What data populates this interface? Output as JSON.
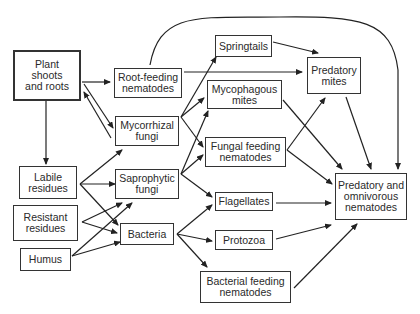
{
  "diagram": {
    "type": "soil food web",
    "nodes": [
      {
        "id": "plant",
        "label": "Plant\nshoots\nand roots"
      },
      {
        "id": "root_nem",
        "label": "Root-feeding\nnematodes"
      },
      {
        "id": "myco_fungi",
        "label": "Mycorrhizal\nfungi"
      },
      {
        "id": "labile",
        "label": "Labile\nresidues"
      },
      {
        "id": "resistant",
        "label": "Resistant\nresidues"
      },
      {
        "id": "humus",
        "label": "Humus"
      },
      {
        "id": "sapro",
        "label": "Saprophytic\nfungi"
      },
      {
        "id": "bacteria",
        "label": "Bacteria"
      },
      {
        "id": "springtails",
        "label": "Springtails"
      },
      {
        "id": "myco_mites",
        "label": "Mycophagous\nmites"
      },
      {
        "id": "fungal_nem",
        "label": "Fungal feeding\nnematodes"
      },
      {
        "id": "flagellates",
        "label": "Flagellates"
      },
      {
        "id": "protozoa",
        "label": "Protozoa"
      },
      {
        "id": "bact_nem",
        "label": "Bacterial feeding\nnematodes"
      },
      {
        "id": "pred_mites",
        "label": "Predatory\nmites"
      },
      {
        "id": "pred_nem",
        "label": "Predatory and\nomnivorous\nnematodes"
      }
    ],
    "edges": [
      [
        "plant",
        "root_nem"
      ],
      [
        "plant",
        "myco_fungi"
      ],
      [
        "myco_fungi",
        "plant"
      ],
      [
        "plant",
        "labile"
      ],
      [
        "labile",
        "sapro"
      ],
      [
        "labile",
        "bacteria"
      ],
      [
        "labile",
        "myco_fungi"
      ],
      [
        "resistant",
        "sapro"
      ],
      [
        "resistant",
        "bacteria"
      ],
      [
        "humus",
        "sapro"
      ],
      [
        "humus",
        "bacteria"
      ],
      [
        "root_nem",
        "pred_mites"
      ],
      [
        "root_nem",
        "pred_nem"
      ],
      [
        "myco_fungi",
        "springtails"
      ],
      [
        "myco_fungi",
        "myco_mites"
      ],
      [
        "myco_fungi",
        "fungal_nem"
      ],
      [
        "sapro",
        "myco_mites"
      ],
      [
        "sapro",
        "fungal_nem"
      ],
      [
        "sapro",
        "flagellates"
      ],
      [
        "bacteria",
        "flagellates"
      ],
      [
        "bacteria",
        "protozoa"
      ],
      [
        "bacteria",
        "bact_nem"
      ],
      [
        "springtails",
        "pred_mites"
      ],
      [
        "myco_mites",
        "pred_nem"
      ],
      [
        "fungal_nem",
        "pred_mites"
      ],
      [
        "fungal_nem",
        "pred_nem"
      ],
      [
        "pred_mites",
        "pred_nem"
      ],
      [
        "flagellates",
        "pred_nem"
      ],
      [
        "protozoa",
        "pred_nem"
      ],
      [
        "bact_nem",
        "pred_nem"
      ]
    ]
  }
}
